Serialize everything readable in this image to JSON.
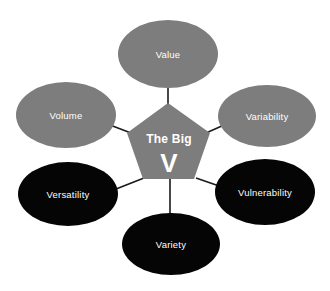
{
  "diagram": {
    "title": "The Big V",
    "center": {
      "shape": "pentagon",
      "line1": "The Big",
      "line2": "V",
      "fill": "#7d7d7d",
      "text_color": "#ffffff"
    },
    "colors": {
      "gray": "#7d7d7d",
      "black": "#050505",
      "connector": "#1a1a1a",
      "background": "#ffffff",
      "label_text": "#ffffff"
    },
    "nodes": [
      {
        "id": "value",
        "label": "Value",
        "fill": "#7d7d7d",
        "position": "top",
        "cx": 168,
        "cy": 54,
        "rx": 50,
        "ry": 34
      },
      {
        "id": "variability",
        "label": "Variability",
        "fill": "#7d7d7d",
        "position": "upper-right",
        "cx": 267,
        "cy": 116,
        "rx": 49,
        "ry": 31
      },
      {
        "id": "vulnerability",
        "label": "Vulnerability",
        "fill": "#050505",
        "position": "lower-right",
        "cx": 265,
        "cy": 192,
        "rx": 50,
        "ry": 33
      },
      {
        "id": "variety",
        "label": "Variety",
        "fill": "#050505",
        "position": "bottom",
        "cx": 171,
        "cy": 244,
        "rx": 49,
        "ry": 31
      },
      {
        "id": "versatility",
        "label": "Versatility",
        "fill": "#050505",
        "position": "lower-left",
        "cx": 68,
        "cy": 194,
        "rx": 50,
        "ry": 32
      },
      {
        "id": "volume",
        "label": "Volume",
        "fill": "#7d7d7d",
        "position": "upper-left",
        "cx": 66,
        "cy": 115,
        "rx": 50,
        "ry": 33
      }
    ],
    "connectors": [
      {
        "from": "center",
        "to": "value"
      },
      {
        "from": "center",
        "to": "variability"
      },
      {
        "from": "center",
        "to": "vulnerability"
      },
      {
        "from": "center",
        "to": "variety"
      },
      {
        "from": "center",
        "to": "versatility"
      },
      {
        "from": "center",
        "to": "volume"
      }
    ]
  }
}
